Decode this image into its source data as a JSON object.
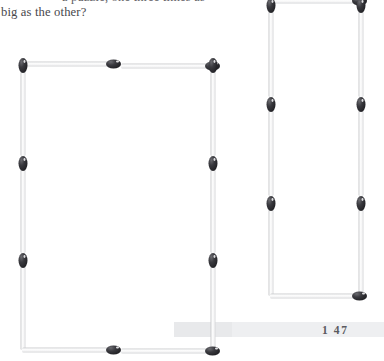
{
  "page": {
    "background_color": "#ffffff",
    "folio": "1 47",
    "band_color": "#e8e9eb"
  },
  "text": {
    "clipped_line": "a puzzle, one three times as",
    "line": "big as the other?",
    "color": "#47474b"
  },
  "matchstick": {
    "body_color": "#fdfdfd",
    "body_edge_color": "#c9cacc",
    "head_color": "#232327",
    "highlight_color": "#f2f2f4"
  },
  "figures": [
    {
      "name": "left-rectangle",
      "description": "wide rectangle made of matchsticks",
      "sticks_top": 2,
      "sticks_bottom": 2,
      "sticks_left": 3,
      "sticks_right": 3
    },
    {
      "name": "right-rectangle",
      "description": "narrow tall rectangle made of matchsticks, clipped at page top",
      "sticks_top": 1,
      "sticks_bottom": 1,
      "sticks_left": 3,
      "sticks_right": 3
    }
  ]
}
